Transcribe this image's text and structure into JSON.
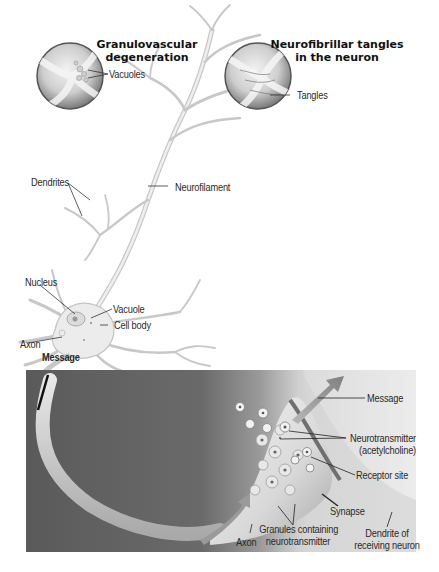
{
  "insets": [
    {
      "title_line1": "Granulovascular",
      "title_line2": "degeneration",
      "labels": [
        "Vacuoles"
      ]
    },
    {
      "title_line1": "Neurofibrillar tangles",
      "title_line2": "in the neuron",
      "labels": [
        "Tangles"
      ]
    }
  ],
  "neuron": {
    "labels": {
      "dendrites": "Dendrites",
      "neurofilament": "Neurofilament",
      "nucleus": "Nucleus",
      "vacuole": "Vacuole",
      "cell_body": "Cell body",
      "axon": "Axon",
      "message": "Message"
    }
  },
  "synapse_panel": {
    "labels": {
      "message": "Message",
      "neurotransmitter_line1": "Neurotransmitter",
      "neurotransmitter_line2": "(acetylcholine)",
      "receptor_site": "Receptor site",
      "synapse": "Synapse",
      "granules_line1": "Granules containing",
      "granules_line2": "neurotransmitter",
      "dendrite_line1": "Dendrite of",
      "dendrite_line2": "receiving neuron",
      "axon": "Axon"
    }
  },
  "colors": {
    "background": "#ffffff",
    "panel_dark": "#5e5e5e",
    "panel_light": "#e2e2e2",
    "neuron_fill": "#e9e9e9",
    "neuron_stroke": "#bdbdbd",
    "label_text": "#2a2a2a",
    "leader_line": "#333333"
  }
}
